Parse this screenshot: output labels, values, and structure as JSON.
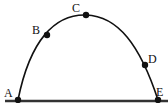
{
  "diagram": {
    "type": "projectile-trajectory",
    "points": [
      {
        "label": "A",
        "x": 18,
        "y": 100,
        "label_x": 4,
        "label_y": 87
      },
      {
        "label": "B",
        "x": 47,
        "y": 35,
        "label_x": 32,
        "label_y": 24
      },
      {
        "label": "C",
        "x": 86,
        "y": 15,
        "label_x": 72,
        "label_y": 2
      },
      {
        "label": "D",
        "x": 145,
        "y": 65,
        "label_x": 148,
        "label_y": 53
      },
      {
        "label": "E",
        "x": 158,
        "y": 100,
        "label_x": 156,
        "label_y": 86
      }
    ],
    "colors": {
      "stroke": "#111111",
      "ground": "#333333",
      "background": "#ffffff"
    }
  }
}
